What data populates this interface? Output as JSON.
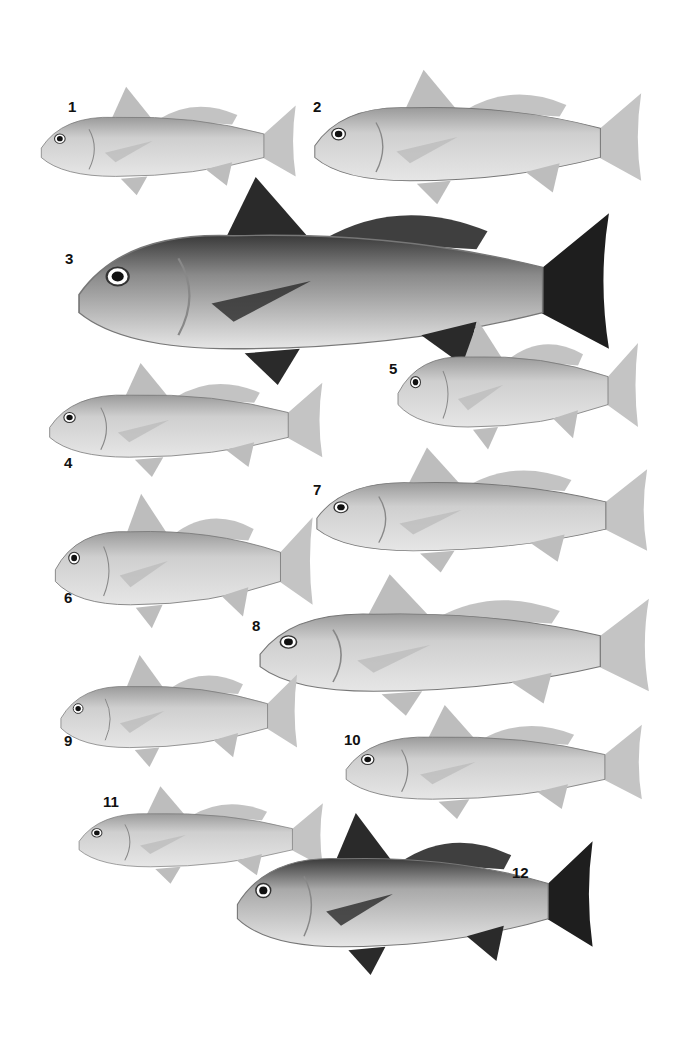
{
  "plate": {
    "fish": [
      {
        "label": "1",
        "shade": "light",
        "x": 36,
        "y": 82,
        "w": 265,
        "h": 118,
        "lx": 68,
        "ly": 106
      },
      {
        "label": "2",
        "shade": "light",
        "x": 308,
        "y": 64,
        "w": 340,
        "h": 146,
        "lx": 313,
        "ly": 106
      },
      {
        "label": "3",
        "shade": "dark",
        "x": 68,
        "y": 168,
        "w": 552,
        "h": 226,
        "lx": 65,
        "ly": 258
      },
      {
        "label": "4",
        "shade": "light",
        "x": 44,
        "y": 358,
        "w": 284,
        "h": 124,
        "lx": 64,
        "ly": 462
      },
      {
        "label": "5",
        "shade": "light",
        "x": 393,
        "y": 315,
        "w": 250,
        "h": 140,
        "lx": 389,
        "ly": 368
      },
      {
        "label": "6",
        "shade": "light",
        "x": 50,
        "y": 488,
        "w": 268,
        "h": 146,
        "lx": 64,
        "ly": 597
      },
      {
        "label": "7",
        "shade": "light",
        "x": 310,
        "y": 442,
        "w": 344,
        "h": 136,
        "lx": 313,
        "ly": 489
      },
      {
        "label": "8",
        "shade": "light",
        "x": 252,
        "y": 568,
        "w": 405,
        "h": 154,
        "lx": 252,
        "ly": 625
      },
      {
        "label": "9",
        "shade": "light",
        "x": 56,
        "y": 650,
        "w": 246,
        "h": 122,
        "lx": 64,
        "ly": 740
      },
      {
        "label": "10",
        "shade": "light",
        "x": 340,
        "y": 700,
        "w": 308,
        "h": 124,
        "lx": 344,
        "ly": 739
      },
      {
        "label": "11",
        "shade": "light",
        "x": 74,
        "y": 782,
        "w": 254,
        "h": 106,
        "lx": 103,
        "ly": 801
      },
      {
        "label": "12",
        "shade": "darkfins",
        "x": 230,
        "y": 806,
        "w": 370,
        "h": 176,
        "lx": 512,
        "ly": 872
      }
    ]
  }
}
